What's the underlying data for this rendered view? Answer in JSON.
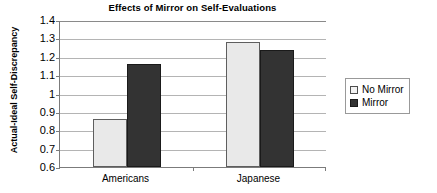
{
  "chart_data": {
    "type": "bar",
    "title": "Effects of Mirror on Self-Evaluations",
    "xlabel": "",
    "ylabel": "Actual-Ideal Self-Discrepancy",
    "categories": [
      "Americans",
      "Japanese"
    ],
    "series": [
      {
        "name": "No Mirror",
        "values": [
          0.86,
          1.28
        ],
        "color": "#e9e9e9"
      },
      {
        "name": "Mirror",
        "values": [
          1.16,
          1.235
        ],
        "color": "#333333"
      }
    ],
    "ylim": [
      0.6,
      1.4
    ],
    "ytick_step": 0.1,
    "ytick_labels": [
      "1.4",
      "1.3",
      "1.2",
      "1.1",
      "1",
      "0.9",
      "0.8",
      "0.7",
      "0.6"
    ],
    "ytick_values": [
      1.4,
      1.3,
      1.2,
      1.1,
      1.0,
      0.9,
      0.8,
      0.7,
      0.6
    ],
    "grid": true,
    "legend_position": "right"
  },
  "legend": {
    "entries": [
      {
        "label": "No Mirror",
        "swatch": "light-swatch-icon"
      },
      {
        "label": "Mirror",
        "swatch": "dark-swatch-icon"
      }
    ]
  }
}
